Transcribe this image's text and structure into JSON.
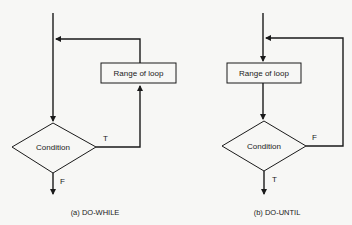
{
  "diagrams": [
    {
      "id": "do-while",
      "caption": "(a) DO-WHILE",
      "box_label": "Range of loop",
      "decision_label": "Condition",
      "true_label": "T",
      "false_label": "F"
    },
    {
      "id": "do-until",
      "caption": "(b) DO-UNTIL",
      "box_label": "Range of loop",
      "decision_label": "Condition",
      "true_label": "T",
      "false_label": "F"
    }
  ],
  "colors": {
    "line": "#1a1a1a",
    "background": "#f7f7f5"
  }
}
